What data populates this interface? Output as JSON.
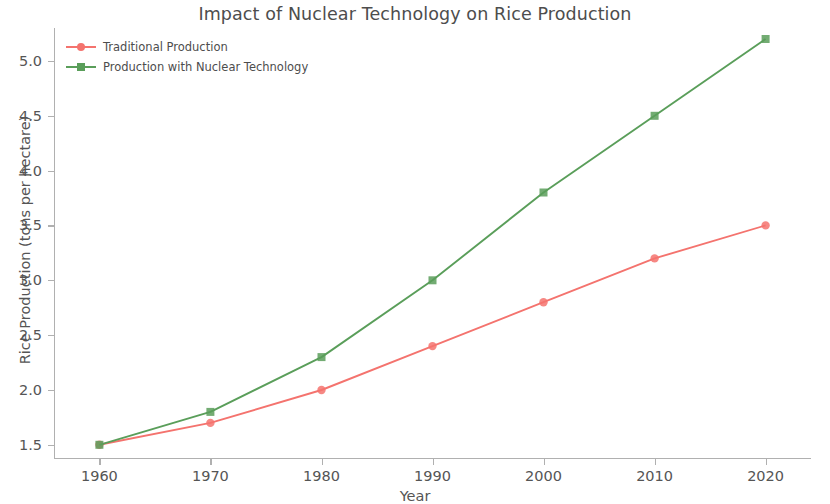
{
  "chart_data": {
    "type": "line",
    "title": "Impact of Nuclear Technology on Rice Production",
    "xlabel": "Year",
    "ylabel": "Rice Production (tons per hectare)",
    "x": [
      1960,
      1970,
      1980,
      1990,
      2000,
      2010,
      2020
    ],
    "xtick_labels": [
      "1960",
      "1970",
      "1980",
      "1990",
      "2000",
      "2010",
      "2020"
    ],
    "ytick_labels": [
      "1.5",
      "2.0",
      "2.5",
      "3.0",
      "3.5",
      "4.0",
      "4.5",
      "5.0"
    ],
    "yticks": [
      1.5,
      2.0,
      2.5,
      3.0,
      3.5,
      4.0,
      4.5,
      5.0
    ],
    "xlim": [
      1956,
      2024
    ],
    "ylim": [
      1.38,
      5.3
    ],
    "grid": false,
    "legend_position": "upper left",
    "series": [
      {
        "name": "Traditional Production",
        "values": [
          1.5,
          1.7,
          2.0,
          2.4,
          2.8,
          3.2,
          3.5
        ],
        "color": "#f4736e",
        "marker": "circle"
      },
      {
        "name": "Production with Nuclear Technology",
        "values": [
          1.5,
          1.8,
          2.3,
          3.0,
          3.8,
          4.5,
          5.2
        ],
        "color": "#5a9e5a",
        "marker": "square"
      }
    ]
  }
}
